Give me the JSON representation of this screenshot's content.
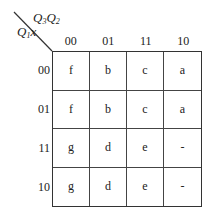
{
  "kmap": {
    "column_variable": {
      "base": "Q",
      "sub1": "3",
      "base2": "Q",
      "sub2": "2"
    },
    "row_variable": {
      "base": "Q",
      "sub1": "1",
      "tail": "x"
    },
    "column_headers": [
      "00",
      "01",
      "11",
      "10"
    ],
    "row_headers": [
      "00",
      "01",
      "11",
      "10"
    ],
    "cells": [
      [
        "f",
        "b",
        "c",
        "a"
      ],
      [
        "f",
        "b",
        "c",
        "a"
      ],
      [
        "g",
        "d",
        "e",
        "-"
      ],
      [
        "g",
        "d",
        "e",
        "-"
      ]
    ]
  }
}
